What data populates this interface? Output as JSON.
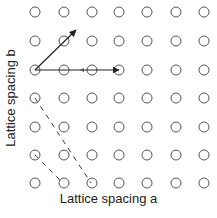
{
  "figure": {
    "xlabel": "Lattice spacing a",
    "ylabel": "Lattice spacing b"
  },
  "lattice": {
    "columns_x": [
      35,
      64,
      92,
      119,
      147,
      176,
      204
    ],
    "rows_y": [
      12,
      41,
      70,
      98,
      127,
      155,
      183
    ],
    "radius": 5,
    "stroke": "#555555"
  },
  "vectors": [
    {
      "name": "vector-a",
      "from": [
        35,
        70
      ],
      "to": [
        119,
        70
      ],
      "mid_arrow_x": 82
    },
    {
      "name": "vector-diagonal",
      "from": [
        35,
        70
      ],
      "to": [
        76,
        30
      ]
    }
  ],
  "dashed_lines": [
    {
      "from": [
        35,
        98
      ],
      "to": [
        91,
        183
      ]
    },
    {
      "from": [
        35,
        155
      ],
      "to": [
        63,
        183
      ]
    }
  ]
}
